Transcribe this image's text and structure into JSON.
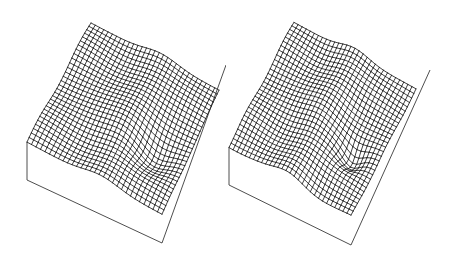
{
  "figure": {
    "colors": {
      "background": "#ffffff",
      "mesh": "#1e1e1e",
      "box": "#3a3a3a"
    },
    "panels": [
      {
        "id": "left",
        "grid_cells": [
          30,
          30
        ],
        "surface": {
          "base_height": 0.55,
          "rise_toward_back": 0.35,
          "ridge": {
            "amp": 0.12,
            "u": 0.55,
            "width": 0.18
          },
          "trough": {
            "amp": -0.18,
            "u": 0.78,
            "v": 0.65,
            "width": 0.14
          },
          "ripple": {
            "amp": 0.04,
            "freq": 3.0
          }
        }
      },
      {
        "id": "right",
        "grid_cells": [
          30,
          30
        ],
        "surface": {
          "base_height": 0.55,
          "rise_toward_back": 0.4,
          "ridge": {
            "amp": 0.14,
            "u": 0.5,
            "width": 0.16
          },
          "trough": {
            "amp": -0.24,
            "u": 0.8,
            "v": 0.62,
            "width": 0.1
          },
          "ripple": {
            "amp": 0.035,
            "freq": 3.4
          }
        }
      }
    ]
  }
}
